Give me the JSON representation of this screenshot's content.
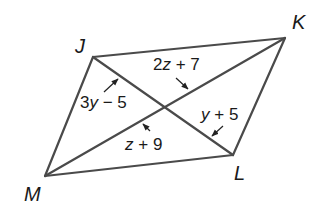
{
  "figure": {
    "type": "parallelogram-with-diagonals",
    "vertices": {
      "J": {
        "label": "J",
        "x": 93,
        "y": 57
      },
      "K": {
        "label": "K",
        "x": 285,
        "y": 38
      },
      "L": {
        "label": "L",
        "x": 233,
        "y": 155
      },
      "M": {
        "label": "M",
        "x": 45,
        "y": 176
      }
    },
    "sides": [
      "JK",
      "KL",
      "LM",
      "MJ"
    ],
    "diagonals": [
      "JL",
      "KM"
    ],
    "segment_labels": [
      {
        "segment": "J-center",
        "coef": "3",
        "var": "y",
        "op": " − ",
        "const": "5",
        "full": "3y − 5"
      },
      {
        "segment": "K-center",
        "coef": "2",
        "var": "z",
        "op": " + ",
        "const": "7",
        "full": "2z + 7"
      },
      {
        "segment": "L-center",
        "coef": "",
        "var": "y",
        "op": " + ",
        "const": "5",
        "full": "y + 5"
      },
      {
        "segment": "M-center",
        "coef": "",
        "var": "z",
        "op": " + ",
        "const": "9",
        "full": "z + 9"
      }
    ],
    "colors": {
      "edge": "#4a4a4a",
      "text": "#1a1a1a",
      "background": "#ffffff"
    }
  }
}
